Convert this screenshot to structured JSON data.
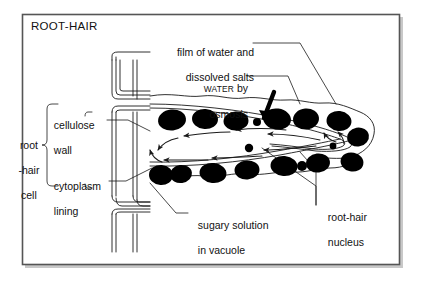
{
  "figure": {
    "title": "ROOT-HAIR",
    "frame": {
      "x": 22,
      "y": 14,
      "width": 378,
      "height": 251,
      "border_color": "#555555",
      "shadow_color": "#9a9a9a",
      "background": "#ffffff"
    },
    "ink_color": "#1a1a1a",
    "soil_particle_color": "#000000"
  },
  "labels": {
    "film_of_water": {
      "line1": "film of water and",
      "line2": "dissolved salts"
    },
    "water_by_osmosis": {
      "word_small_caps": "WATER",
      "rest": " by",
      "line2": "osmosis"
    },
    "cellulose_wall": {
      "line1": "cellulose",
      "line2": "wall"
    },
    "cytoplasm_lining": {
      "line1": "cytoplasm",
      "line2": "lining"
    },
    "root_hair_cell": {
      "line1": "root",
      "line2": "-hair",
      "line3": "cell"
    },
    "sugary_solution": {
      "line1": "sugary solution",
      "line2": "in vacuole"
    },
    "root_hair_nucleus": {
      "line1": "root-hair",
      "line2": "nucleus"
    }
  },
  "annotations": {
    "flow_arrows_meaning": "water moves by osmosis from soil film into the root-hair cell vacuole",
    "thick_arrow_meaning": "WATER by osmosis entering the root hair"
  }
}
